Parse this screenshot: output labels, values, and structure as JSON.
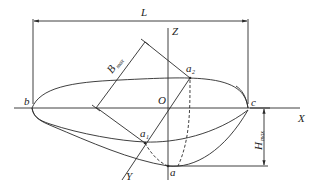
{
  "diagram": {
    "colors": {
      "stroke": "#2a2a2a",
      "background": "#ffffff"
    },
    "labels": {
      "length": "L",
      "breadth_main": "B",
      "breadth_sub": "max",
      "height_main": "H",
      "height_sub": "max",
      "axis_x": "X",
      "axis_y": "Y",
      "axis_z": "Z",
      "origin": "O",
      "point_b": "b",
      "point_c": "c",
      "point_a": "a",
      "point_a1_main": "a",
      "point_a1_sub": "1",
      "point_a2_main": "a",
      "point_a2_sub": "2"
    }
  }
}
